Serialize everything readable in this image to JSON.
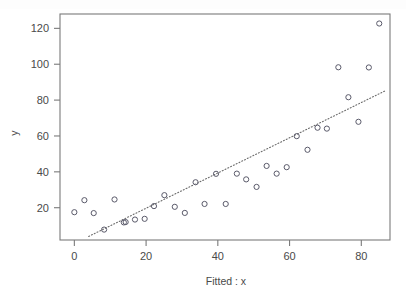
{
  "figure": {
    "kind": "scatter-plot-with-fit-line",
    "background_color": "#ffffff",
    "frame_color": "#7a7a7a",
    "point_color": "#5a5a6a",
    "line_color": "#6a6a6a"
  },
  "axes": {
    "x_title": "Fitted : x",
    "y_title": "y",
    "x_ticks": [
      "0",
      "20",
      "40",
      "60",
      "80"
    ],
    "y_ticks": [
      "20",
      "40",
      "60",
      "80",
      "100",
      "120"
    ]
  },
  "chart_data": {
    "type": "scatter",
    "title": "",
    "subtitle": "",
    "xlabel": "Fitted : x",
    "ylabel": "y",
    "xlim": [
      -4,
      88
    ],
    "ylim": [
      2,
      128
    ],
    "grid": false,
    "legend": null,
    "x_ticks": [
      0,
      20,
      40,
      60,
      80
    ],
    "y_ticks": [
      20,
      40,
      60,
      80,
      100,
      120
    ],
    "marker": "open-circle",
    "series": [
      {
        "name": "observations",
        "points": [
          [
            0.0,
            17.5
          ],
          [
            2.8,
            24.2
          ],
          [
            5.4,
            17.0
          ],
          [
            8.3,
            7.8
          ],
          [
            11.2,
            24.6
          ],
          [
            13.8,
            11.8
          ],
          [
            14.3,
            12.0
          ],
          [
            16.9,
            13.4
          ],
          [
            19.6,
            13.8
          ],
          [
            22.2,
            20.9
          ],
          [
            25.1,
            27.0
          ],
          [
            28.0,
            20.5
          ],
          [
            30.8,
            17.1
          ],
          [
            33.8,
            34.2
          ],
          [
            36.3,
            22.1
          ],
          [
            39.5,
            38.9
          ],
          [
            42.2,
            22.1
          ],
          [
            45.3,
            39.0
          ],
          [
            47.9,
            35.8
          ],
          [
            50.8,
            31.6
          ],
          [
            53.6,
            43.3
          ],
          [
            56.4,
            39.0
          ],
          [
            59.2,
            42.6
          ],
          [
            62.0,
            59.9
          ],
          [
            65.0,
            52.3
          ],
          [
            67.8,
            64.6
          ],
          [
            70.4,
            64.1
          ],
          [
            73.6,
            98.3
          ],
          [
            76.4,
            81.6
          ],
          [
            79.2,
            67.9
          ],
          [
            82.1,
            98.2
          ],
          [
            85.0,
            122.7
          ]
        ]
      }
    ],
    "fit_line": {
      "name": "fitted-line",
      "style": "dotted",
      "x_start": 4.0,
      "y_start": 4.0,
      "x_end": 87.0,
      "y_end": 85.5,
      "slope": 0.982,
      "intercept": 0.07
    }
  }
}
